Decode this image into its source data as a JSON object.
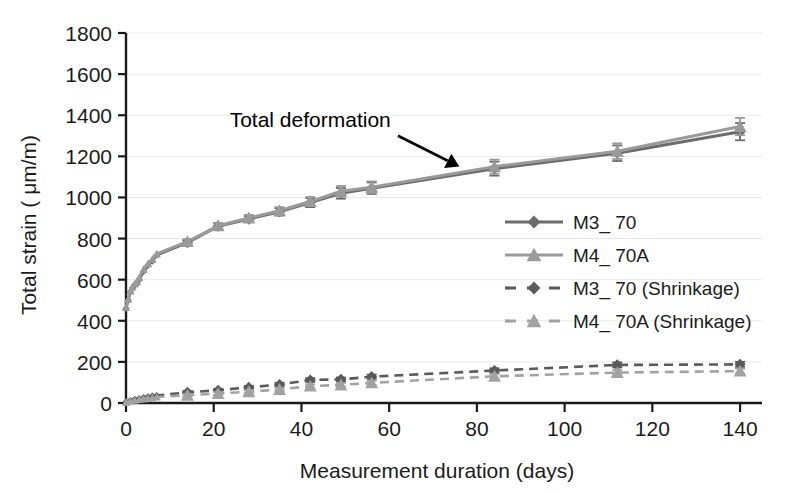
{
  "chart_data": {
    "type": "line",
    "title": "",
    "xlabel": "Measurement duration (days)",
    "ylabel": "Total strain ( μm/m)",
    "xlim": [
      0,
      145
    ],
    "ylim": [
      0,
      1800
    ],
    "xticks": [
      0,
      20,
      40,
      60,
      80,
      100,
      120,
      140
    ],
    "yticks": [
      0,
      200,
      400,
      600,
      800,
      1000,
      1200,
      1400,
      1600,
      1800
    ],
    "grid": "horizontal",
    "legend_position": "center-right",
    "annotations": [
      {
        "text": "Total deformation",
        "text_x": 42,
        "text_y": 1345,
        "arrow_from_x": 62,
        "arrow_from_y": 1300,
        "arrow_to_x": 76,
        "arrow_to_y": 1150
      }
    ],
    "series": [
      {
        "name": "M3_ 70",
        "legend_label": "M3_ 70",
        "marker": "diamond",
        "color": "#6c6c6c",
        "linestyle": "solid",
        "x": [
          0,
          0.5,
          1,
          1.5,
          2,
          2.5,
          3,
          4,
          5,
          6,
          7,
          14,
          21,
          28,
          35,
          42,
          49,
          56,
          84,
          112,
          140
        ],
        "y": [
          460,
          500,
          540,
          560,
          575,
          580,
          600,
          640,
          670,
          690,
          720,
          780,
          860,
          895,
          930,
          975,
          1020,
          1045,
          1140,
          1215,
          1320
        ],
        "yerr": [
          0,
          0,
          0,
          0,
          0,
          0,
          0,
          0,
          0,
          0,
          0,
          12,
          14,
          15,
          18,
          22,
          26,
          28,
          34,
          38,
          42
        ]
      },
      {
        "name": "M4_ 70A",
        "legend_label": "M4_ 70A",
        "marker": "triangle",
        "color": "#9a9a9a",
        "linestyle": "solid",
        "x": [
          0,
          0.5,
          1,
          1.5,
          2,
          2.5,
          3,
          4,
          5,
          6,
          7,
          14,
          21,
          28,
          35,
          42,
          49,
          56,
          84,
          112,
          140
        ],
        "y": [
          465,
          505,
          545,
          565,
          580,
          590,
          610,
          650,
          678,
          700,
          725,
          785,
          862,
          900,
          935,
          980,
          1030,
          1050,
          1150,
          1225,
          1345
        ],
        "yerr": [
          0,
          0,
          0,
          0,
          0,
          0,
          0,
          0,
          0,
          0,
          0,
          12,
          14,
          15,
          18,
          22,
          26,
          28,
          34,
          38,
          42
        ]
      },
      {
        "name": "M3_ 70 (Shrinkage)",
        "legend_label": "M3_ 70 (Shrinkage)",
        "marker": "diamond",
        "color": "#5a5a5a",
        "linestyle": "dashed",
        "x": [
          0,
          1,
          2,
          3,
          4,
          5,
          6,
          7,
          14,
          21,
          28,
          35,
          42,
          49,
          56,
          84,
          112,
          140
        ],
        "y": [
          5,
          12,
          18,
          22,
          26,
          30,
          33,
          36,
          52,
          62,
          76,
          90,
          112,
          115,
          128,
          158,
          185,
          188
        ],
        "yerr": [
          0,
          0,
          0,
          0,
          0,
          0,
          0,
          0,
          6,
          7,
          7,
          8,
          9,
          9,
          10,
          11,
          12,
          12
        ]
      },
      {
        "name": "M4_ 70A (Shrinkage)",
        "legend_label": "M4_ 70A (Shrinkage)",
        "marker": "triangle",
        "color": "#a2a2a2",
        "linestyle": "dashed",
        "x": [
          0,
          1,
          2,
          3,
          4,
          5,
          6,
          7,
          14,
          21,
          28,
          35,
          42,
          49,
          56,
          84,
          112,
          140
        ],
        "y": [
          3,
          8,
          13,
          17,
          20,
          23,
          26,
          29,
          38,
          46,
          55,
          66,
          82,
          88,
          98,
          130,
          148,
          155
        ],
        "yerr": [
          0,
          0,
          0,
          0,
          0,
          0,
          0,
          0,
          6,
          7,
          7,
          8,
          9,
          9,
          10,
          11,
          12,
          12
        ]
      }
    ]
  },
  "axes": {
    "x_title": "Measurement duration (days)",
    "y_title": "Total strain ( μm/m)",
    "x_tick_labels": [
      "0",
      "20",
      "40",
      "60",
      "80",
      "100",
      "120",
      "140"
    ],
    "y_tick_labels": [
      "0",
      "200",
      "400",
      "600",
      "800",
      "1000",
      "1200",
      "1400",
      "1600",
      "1800"
    ]
  },
  "legend": {
    "entries": [
      {
        "label": "M3_ 70",
        "marker": "diamond",
        "linestyle": "solid",
        "color": "#6c6c6c"
      },
      {
        "label": "M4_ 70A",
        "marker": "triangle",
        "linestyle": "solid",
        "color": "#9a9a9a"
      },
      {
        "label": "M3_ 70 (Shrinkage)",
        "marker": "diamond",
        "linestyle": "dashed",
        "color": "#5a5a5a"
      },
      {
        "label": "M4_ 70A (Shrinkage)",
        "marker": "triangle",
        "linestyle": "dashed",
        "color": "#a2a2a2"
      }
    ]
  },
  "annotation": {
    "label": "Total deformation"
  },
  "colors": {
    "background": "#ffffff",
    "axis": "#1b1b1b",
    "grid": "#e9e9ea",
    "series_dark": "#6c6c6c",
    "series_light": "#9a9a9a",
    "annotation": "#000000"
  }
}
